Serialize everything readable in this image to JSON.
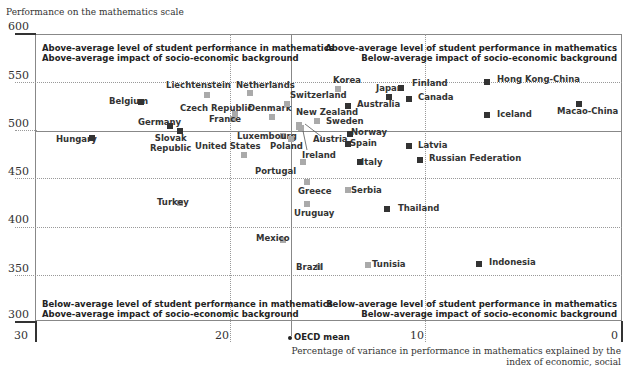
{
  "chart_data": {
    "type": "scatter",
    "title": "",
    "ylabel": "Performance on the mathematics scale",
    "xlabel": "Percentage of variance in performance in mathematics explained by the index of economic, social",
    "ylim": [
      300,
      600
    ],
    "xlim": [
      30,
      0
    ],
    "x_reversed": true,
    "yticks": [
      "600",
      "550",
      "500",
      "450",
      "400",
      "350",
      "300"
    ],
    "xticks": [
      "30",
      "20",
      "10",
      "0"
    ],
    "oecd_mean_label": "OECD mean",
    "oecd_mean": {
      "x": 16.9,
      "y": 500
    },
    "quadrants": {
      "top_left": [
        "Above-average level of student performance in mathematics",
        "Above-average impact of socio-economic background"
      ],
      "top_right": [
        "Above-average level of student performance in mathematics",
        "Below-average impact of socio-economic background"
      ],
      "bottom_left": [
        "Below-average level of student performance in mathematics",
        "Above-average impact of socio-economic background"
      ],
      "bottom_right": [
        "Below-average level of student performance in mathematics",
        "Below-average impact of socio-economic background"
      ]
    },
    "legend_note": {
      "dark": "#333333",
      "light": "#aaaaaa"
    },
    "points": [
      {
        "name": "Belgium",
        "x": 24.6,
        "y": 529,
        "dark": true,
        "lx": 109,
        "ly": 96
      },
      {
        "name": "Liechtenstein",
        "x": 21.2,
        "y": 536,
        "dark": false,
        "lx": 166,
        "ly": 80
      },
      {
        "name": "Netherlands",
        "x": 19.0,
        "y": 538,
        "dark": false,
        "lx": 236,
        "ly": 80
      },
      {
        "name": "Czech Republic",
        "x": 19.8,
        "y": 516,
        "dark": false,
        "lx": 180,
        "ly": 103
      },
      {
        "name": "France",
        "x": 19.9,
        "y": 511,
        "dark": false,
        "lx": 209,
        "ly": 114
      },
      {
        "name": "Denmark",
        "x": 17.9,
        "y": 513,
        "dark": false,
        "lx": 248,
        "ly": 103
      },
      {
        "name": "Switzerland",
        "x": 17.1,
        "y": 527,
        "dark": false,
        "lx": 290,
        "ly": 90
      },
      {
        "name": "Germany",
        "x": 23.1,
        "y": 504,
        "dark": true,
        "lx": 138,
        "ly": 117
      },
      {
        "name": "Slovak Republic",
        "x": 22.6,
        "y": 499,
        "dark": true,
        "lx": 150,
        "ly": 133,
        "multiline": [
          "Slovak",
          "Republic"
        ]
      },
      {
        "name": "Hungary",
        "x": 27.1,
        "y": 491,
        "dark": true,
        "lx": 56,
        "ly": 134
      },
      {
        "name": "United States",
        "x": 19.3,
        "y": 474,
        "dark": false,
        "lx": 195,
        "ly": 141
      },
      {
        "name": "Luxembourg",
        "x": 17.3,
        "y": 493,
        "dark": false,
        "lx": 237,
        "ly": 131
      },
      {
        "name": "Poland",
        "x": 16.9,
        "y": 490,
        "dark": false,
        "lx": 270,
        "ly": 141
      },
      {
        "name": "New Zealand",
        "x": 16.5,
        "y": 505,
        "dark": false,
        "lx": 296,
        "ly": 107
      },
      {
        "name": "Austria",
        "x": 16.5,
        "y": 503,
        "dark": false,
        "lx": 313,
        "ly": 134
      },
      {
        "name": "Ireland",
        "x": 16.4,
        "y": 502,
        "dark": false,
        "lx": 302,
        "ly": 150
      },
      {
        "name": "Sweden",
        "x": 15.6,
        "y": 509,
        "dark": false,
        "lx": 326,
        "ly": 116
      },
      {
        "name": "Korea",
        "x": 14.5,
        "y": 542,
        "dark": false,
        "lx": 333,
        "ly": 75
      },
      {
        "name": "Australia",
        "x": 14.0,
        "y": 525,
        "dark": true,
        "lx": 357,
        "ly": 99
      },
      {
        "name": "Japan",
        "x": 11.9,
        "y": 534,
        "dark": true,
        "lx": 376,
        "ly": 83
      },
      {
        "name": "Finland",
        "x": 11.3,
        "y": 544,
        "dark": true,
        "lx": 412,
        "ly": 78
      },
      {
        "name": "Canada",
        "x": 10.9,
        "y": 532,
        "dark": true,
        "lx": 418,
        "ly": 92
      },
      {
        "name": "Hong Kong-China",
        "x": 6.9,
        "y": 550,
        "dark": true,
        "lx": 497,
        "ly": 74
      },
      {
        "name": "Iceland",
        "x": 6.9,
        "y": 515,
        "dark": true,
        "lx": 497,
        "ly": 109
      },
      {
        "name": "Macao-China",
        "x": 2.2,
        "y": 527,
        "dark": true,
        "lx": 557,
        "ly": 106
      },
      {
        "name": "Norway",
        "x": 13.9,
        "y": 495,
        "dark": true,
        "lx": 351,
        "ly": 127
      },
      {
        "name": "Spain",
        "x": 14.0,
        "y": 485,
        "dark": true,
        "lx": 350,
        "ly": 138
      },
      {
        "name": "Latvia",
        "x": 10.9,
        "y": 483,
        "dark": true,
        "lx": 418,
        "ly": 140
      },
      {
        "name": "Italy",
        "x": 13.4,
        "y": 466,
        "dark": true,
        "lx": 361,
        "ly": 157
      },
      {
        "name": "Russian Federation",
        "x": 10.3,
        "y": 468,
        "dark": true,
        "lx": 429,
        "ly": 153
      },
      {
        "name": "Portugal",
        "x": 16.3,
        "y": 466,
        "dark": false,
        "lx": 255,
        "ly": 166
      },
      {
        "name": "Greece",
        "x": 16.1,
        "y": 445,
        "dark": false,
        "lx": 298,
        "ly": 186
      },
      {
        "name": "Serbia",
        "x": 14.0,
        "y": 437,
        "dark": false,
        "lx": 351,
        "ly": 185
      },
      {
        "name": "Uruguay",
        "x": 16.1,
        "y": 422,
        "dark": false,
        "lx": 294,
        "ly": 208
      },
      {
        "name": "Thailand",
        "x": 12.0,
        "y": 417,
        "dark": true,
        "lx": 398,
        "ly": 203
      },
      {
        "name": "Turkey",
        "x": 22.6,
        "y": 423,
        "dark": false,
        "lx": 157,
        "ly": 197
      },
      {
        "name": "Mexico",
        "x": 17.3,
        "y": 385,
        "dark": false,
        "lx": 256,
        "ly": 233
      },
      {
        "name": "Brazil",
        "x": 15.5,
        "y": 356,
        "dark": false,
        "lx": 296,
        "ly": 262
      },
      {
        "name": "Tunisia",
        "x": 13.0,
        "y": 359,
        "dark": false,
        "lx": 372,
        "ly": 259
      },
      {
        "name": "Indonesia",
        "x": 7.3,
        "y": 360,
        "dark": true,
        "lx": 489,
        "ly": 257
      }
    ]
  }
}
